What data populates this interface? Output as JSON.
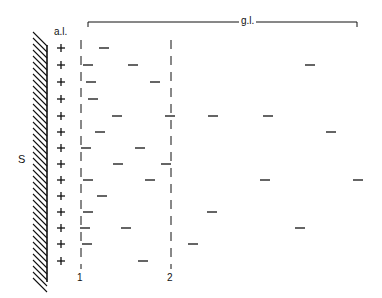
{
  "labels": {
    "surface": "S",
    "al": "a.l.",
    "gl": "g.l.",
    "col1": "1",
    "col2": "2"
  },
  "rows_y": [
    48,
    65,
    82,
    99,
    116,
    132,
    148,
    164,
    180,
    196,
    212,
    228,
    244,
    261
  ],
  "plus_x": 61,
  "col1_x": 81,
  "col2_x": 171,
  "dashes": [
    [
      104,
      48
    ],
    [
      88,
      65
    ],
    [
      133,
      65
    ],
    [
      310,
      65
    ],
    [
      91,
      82
    ],
    [
      155,
      82
    ],
    [
      93,
      99
    ],
    [
      117,
      116
    ],
    [
      170,
      116
    ],
    [
      213,
      116
    ],
    [
      268,
      116
    ],
    [
      100,
      132
    ],
    [
      331,
      132
    ],
    [
      86,
      148
    ],
    [
      140,
      148
    ],
    [
      118,
      164
    ],
    [
      166,
      164
    ],
    [
      88,
      180
    ],
    [
      150,
      180
    ],
    [
      265,
      180
    ],
    [
      358,
      180
    ],
    [
      102,
      196
    ],
    [
      88,
      212
    ],
    [
      212,
      212
    ],
    [
      85,
      228
    ],
    [
      126,
      228
    ],
    [
      300,
      228
    ],
    [
      87,
      244
    ],
    [
      193,
      244
    ],
    [
      143,
      261
    ]
  ],
  "bracket": {
    "x1": 88,
    "x2": 357,
    "y": 22
  }
}
